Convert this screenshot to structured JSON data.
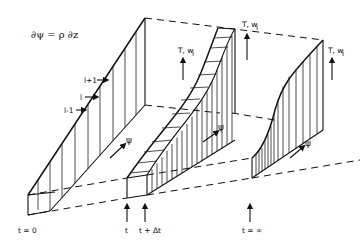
{
  "diagram": {
    "equation": "∂ψ = ρ ∂z",
    "layer_labels": [
      "l+1",
      "l",
      "l-1"
    ],
    "axis_label_psi": "ψ",
    "axis_label_values": "T, w",
    "axis_label_values_subscript": "i",
    "time_labels": {
      "t0": "t = 0",
      "t": "t",
      "t_dt": "t + Δt",
      "t_inf": "t = ∞"
    }
  }
}
